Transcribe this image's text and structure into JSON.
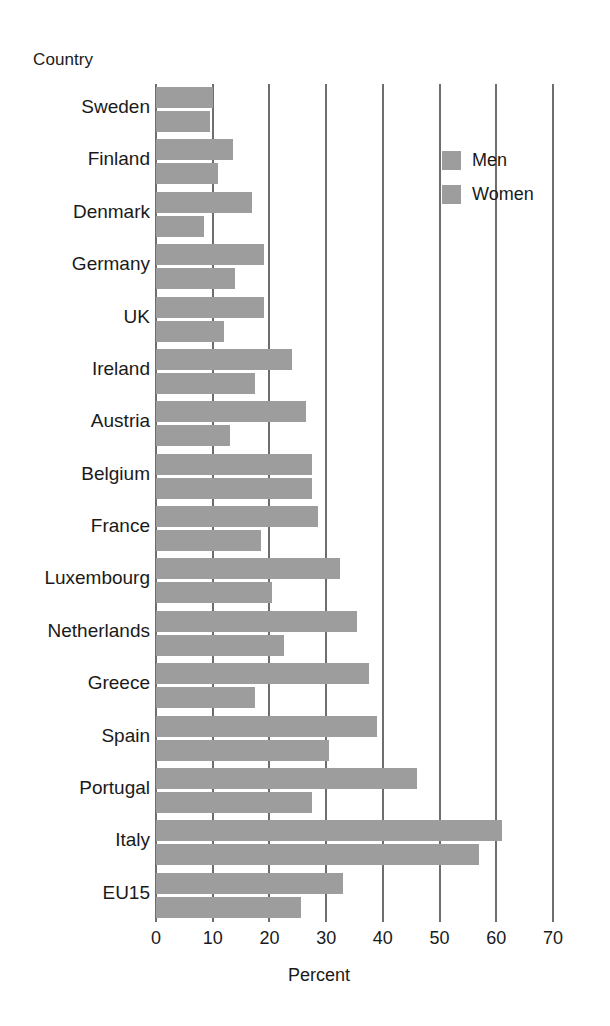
{
  "chart_data": {
    "type": "bar",
    "orientation": "horizontal",
    "title": "",
    "xlabel": "Percent",
    "ylabel": "Country",
    "xlim": [
      0,
      70
    ],
    "xticks": [
      0,
      10,
      20,
      30,
      40,
      50,
      60,
      70
    ],
    "grid": true,
    "legend_position": "top-right",
    "bar_color": "#9d9d9d",
    "axis_color": "#6e6e6e",
    "categories": [
      "Sweden",
      "Finland",
      "Denmark",
      "Germany",
      "UK",
      "Ireland",
      "Austria",
      "Belgium",
      "France",
      "Luxembourg",
      "Netherlands",
      "Greece",
      "Spain",
      "Portugal",
      "Italy",
      "EU15"
    ],
    "series": [
      {
        "name": "Men",
        "values": [
          10,
          13.5,
          17,
          19,
          19,
          24,
          26.5,
          27.5,
          28.5,
          32.5,
          35.5,
          37.5,
          39,
          46,
          61,
          33
        ]
      },
      {
        "name": "Women",
        "values": [
          9.5,
          11,
          8.5,
          14,
          12,
          17.5,
          13,
          27.5,
          18.5,
          20.5,
          22.5,
          17.5,
          30.5,
          27.5,
          57,
          25.5
        ]
      }
    ]
  },
  "legend": {
    "items": [
      {
        "label": "Men"
      },
      {
        "label": "Women"
      }
    ]
  },
  "axes": {
    "y_title": "Country",
    "x_title": "Percent"
  }
}
